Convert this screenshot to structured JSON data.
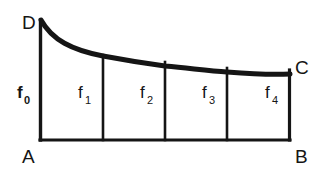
{
  "figure": {
    "type": "math-diagram",
    "background_color": "#ffffff",
    "ink_color": "#151515",
    "vertices": [
      {
        "name": "vertex-D",
        "label": "D",
        "x": 24,
        "y": 28,
        "role": "curve-start-top-left"
      },
      {
        "name": "vertex-C",
        "label": "C",
        "x": 296,
        "y": 73,
        "role": "curve-end-top-right"
      },
      {
        "name": "vertex-A",
        "label": "A",
        "x": 24,
        "y": 162,
        "role": "baseline-left"
      },
      {
        "name": "vertex-B",
        "label": "B",
        "x": 296,
        "y": 162,
        "role": "baseline-right"
      }
    ],
    "ordinates": [
      {
        "name": "ordinate-f0",
        "label": "f",
        "subscript": "0",
        "x": 40,
        "top_y": 21,
        "bottom_y": 140,
        "label_x": 18,
        "label_y": 100,
        "weight": "bold"
      },
      {
        "name": "ordinate-f1",
        "label": "f",
        "subscript": "1",
        "x": 103,
        "top_y": 55,
        "bottom_y": 140,
        "label_x": 79,
        "label_y": 100,
        "weight": "normal"
      },
      {
        "name": "ordinate-f2",
        "label": "f",
        "subscript": "2",
        "x": 165,
        "top_y": 62,
        "bottom_y": 140,
        "label_x": 141,
        "label_y": 100,
        "weight": "normal"
      },
      {
        "name": "ordinate-f3",
        "label": "f",
        "subscript": "3",
        "x": 227,
        "top_y": 68,
        "bottom_y": 140,
        "label_x": 203,
        "label_y": 100,
        "weight": "normal"
      },
      {
        "name": "ordinate-f4",
        "label": "f",
        "subscript": "4",
        "x": 290,
        "top_y": 72,
        "bottom_y": 140,
        "label_x": 266,
        "label_y": 100,
        "weight": "normal"
      }
    ],
    "baseline": {
      "name": "baseline-AB",
      "x1": 40,
      "y1": 140,
      "x2": 290,
      "y2": 140
    },
    "curve": {
      "name": "curve-DC",
      "path": "M 41 20 C 52 40, 72 50, 103 56 C 135 62, 150 64, 165 66 C 196 69, 210 71, 227 72 C 252 74, 272 75, 290 74",
      "stroke_width": 5,
      "points": [
        {
          "x": 41,
          "y": 20
        },
        {
          "x": 103,
          "y": 56
        },
        {
          "x": 165,
          "y": 66
        },
        {
          "x": 227,
          "y": 72
        },
        {
          "x": 290,
          "y": 74
        }
      ]
    }
  }
}
